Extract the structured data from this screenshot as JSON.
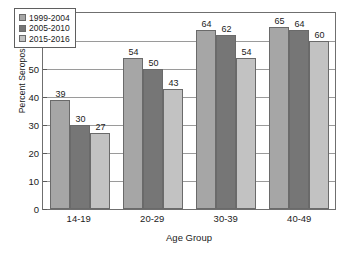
{
  "chart_data": {
    "type": "bar",
    "title": "",
    "subtitle": "",
    "xlabel": "Age Group",
    "ylabel": "Percent Seropositive",
    "categories": [
      "14-19",
      "20-29",
      "30-39",
      "40-49"
    ],
    "series": [
      {
        "name": "1999-2004",
        "values": [
          39,
          54,
          64,
          65
        ],
        "color": "#a6a6a6"
      },
      {
        "name": "2005-2010",
        "values": [
          30,
          50,
          62,
          64
        ],
        "color": "#767676"
      },
      {
        "name": "2015-2016",
        "values": [
          27,
          43,
          54,
          60
        ],
        "color": "#c2c2c2"
      }
    ],
    "ylim": [
      0,
      70
    ],
    "yticks": [
      0,
      10,
      20,
      30,
      40,
      50,
      60,
      70
    ],
    "ytick_labels": [
      "0",
      "10",
      "20",
      "30",
      "40",
      "50",
      "60",
      "70"
    ],
    "grid": true,
    "grid_axis": "y",
    "legend_position": "upper left",
    "data_labels": true,
    "bar_mode": "grouped"
  },
  "colors": {
    "axis": "#6f6f6f",
    "grid": "#9a9a9a",
    "text": "#1b1b1b",
    "background": "#ffffff"
  }
}
